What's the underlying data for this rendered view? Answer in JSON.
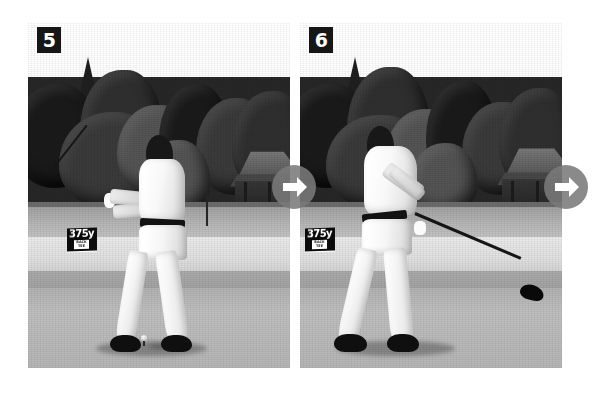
{
  "page": {
    "background_color": "#ffffff",
    "width": 606,
    "height": 394
  },
  "frames": [
    {
      "id": "frame-5",
      "number": "5",
      "caption": "",
      "yardage_sign": {
        "distance": "375y",
        "sub_label": "BACK TEE"
      },
      "scene": {
        "sky": "overcast bright sky",
        "background": "dense dark treeline",
        "foreground": "fairway tee deck",
        "subject": "golfer at mid-downswing, hands at hip height",
        "ball_on_tee": true,
        "pavilion_visible": true
      }
    },
    {
      "id": "frame-6",
      "number": "6",
      "caption": "",
      "yardage_sign": {
        "distance": "375y",
        "sub_label": "BACK TEE"
      },
      "scene": {
        "sky": "overcast bright sky",
        "background": "dense dark treeline",
        "foreground": "fairway tee deck",
        "subject": "golfer just past impact, club extended low and right",
        "ball_on_tee": false,
        "pavilion_visible": true
      }
    }
  ],
  "controls": {
    "next_label": "Next",
    "arrows": [
      {
        "name": "next-frame-5",
        "icon": "arrow-right-icon",
        "color": "#7a7a7a"
      },
      {
        "name": "next-frame-6",
        "icon": "arrow-right-icon",
        "color": "#7a7a7a"
      }
    ]
  },
  "colors": {
    "badge_background": "#161616",
    "badge_text": "#ffffff",
    "sign_background": "#111111",
    "sign_text": "#ffffff",
    "arrow_circle": "#7a7a7a",
    "arrow_glyph": "#ffffff"
  }
}
